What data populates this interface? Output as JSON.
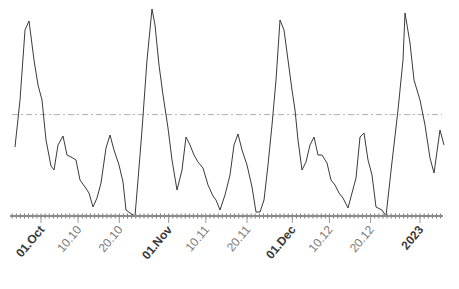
{
  "chart_data": {
    "type": "line",
    "title": "",
    "xlabel": "",
    "ylabel": "",
    "grid": false,
    "legend": null,
    "x_range": [
      "2022-09-27",
      "2023-01-03"
    ],
    "x_tick_labels": [
      {
        "label": "01.Oct",
        "date": "2022-10-01",
        "bold": true
      },
      {
        "label": "10.10",
        "date": "2022-10-10",
        "bold": false
      },
      {
        "label": "20.10",
        "date": "2022-10-20",
        "bold": false
      },
      {
        "label": "01.Nov",
        "date": "2022-11-01",
        "bold": true
      },
      {
        "label": "10.11",
        "date": "2022-11-10",
        "bold": false
      },
      {
        "label": "20.11",
        "date": "2022-11-20",
        "bold": false
      },
      {
        "label": "01.Dec",
        "date": "2022-12-01",
        "bold": true
      },
      {
        "label": "10.12",
        "date": "2022-12-10",
        "bold": false
      },
      {
        "label": "20.12",
        "date": "2022-12-20",
        "bold": false
      },
      {
        "label": "2023",
        "date": "2023-01-01",
        "bold": true
      }
    ],
    "reference_line": {
      "style": "dash-dot",
      "relative_level": 0.49
    },
    "y_axis_visible": false,
    "series": [
      {
        "name": "value",
        "note": "relative values 0 (baseline) to 1 (highest peak), estimated from pixel positions",
        "points_px": [
          [
            15,
            147
          ],
          [
            20,
            100
          ],
          [
            25,
            30
          ],
          [
            29,
            21
          ],
          [
            34,
            60
          ],
          [
            38,
            85
          ],
          [
            42,
            100
          ],
          [
            46,
            140
          ],
          [
            51,
            166
          ],
          [
            54,
            170
          ],
          [
            58,
            145
          ],
          [
            63,
            136
          ],
          [
            67,
            155
          ],
          [
            71,
            157
          ],
          [
            76,
            160
          ],
          [
            80,
            180
          ],
          [
            85,
            187
          ],
          [
            89,
            193
          ],
          [
            93,
            207
          ],
          [
            97,
            198
          ],
          [
            101,
            183
          ],
          [
            106,
            148
          ],
          [
            110,
            135
          ],
          [
            114,
            150
          ],
          [
            119,
            165
          ],
          [
            123,
            182
          ],
          [
            126,
            210
          ],
          [
            130,
            213
          ],
          [
            135,
            216
          ],
          [
            138,
            180
          ],
          [
            142,
            130
          ],
          [
            147,
            60
          ],
          [
            152,
            9
          ],
          [
            155,
            25
          ],
          [
            159,
            65
          ],
          [
            163,
            95
          ],
          [
            168,
            128
          ],
          [
            172,
            160
          ],
          [
            177,
            190
          ],
          [
            182,
            170
          ],
          [
            186,
            137
          ],
          [
            190,
            145
          ],
          [
            194,
            155
          ],
          [
            198,
            162
          ],
          [
            203,
            168
          ],
          [
            208,
            185
          ],
          [
            213,
            196
          ],
          [
            216,
            200
          ],
          [
            220,
            210
          ],
          [
            225,
            195
          ],
          [
            230,
            175
          ],
          [
            234,
            145
          ],
          [
            238,
            134
          ],
          [
            242,
            150
          ],
          [
            247,
            165
          ],
          [
            252,
            187
          ],
          [
            256,
            212
          ],
          [
            260,
            212
          ],
          [
            264,
            200
          ],
          [
            268,
            165
          ],
          [
            272,
            125
          ],
          [
            276,
            80
          ],
          [
            280,
            20
          ],
          [
            284,
            30
          ],
          [
            288,
            60
          ],
          [
            292,
            90
          ],
          [
            295,
            110
          ],
          [
            298,
            140
          ],
          [
            302,
            170
          ],
          [
            306,
            162
          ],
          [
            310,
            145
          ],
          [
            314,
            137
          ],
          [
            318,
            155
          ],
          [
            322,
            155
          ],
          [
            327,
            163
          ],
          [
            331,
            180
          ],
          [
            335,
            185
          ],
          [
            339,
            193
          ],
          [
            343,
            198
          ],
          [
            348,
            208
          ],
          [
            352,
            193
          ],
          [
            356,
            178
          ],
          [
            360,
            137
          ],
          [
            364,
            133
          ],
          [
            368,
            160
          ],
          [
            372,
            175
          ],
          [
            376,
            207
          ],
          [
            382,
            210
          ],
          [
            386,
            216
          ],
          [
            392,
            162
          ],
          [
            398,
            110
          ],
          [
            403,
            60
          ],
          [
            405,
            13
          ],
          [
            410,
            43
          ],
          [
            414,
            80
          ],
          [
            420,
            100
          ],
          [
            425,
            125
          ],
          [
            430,
            158
          ],
          [
            434,
            173
          ],
          [
            440,
            130
          ],
          [
            444,
            145
          ]
        ]
      }
    ],
    "peaks_approx": [
      {
        "date": "2022-10-04",
        "relative": 0.93
      },
      {
        "date": "2022-10-29",
        "relative": 1.0
      },
      {
        "date": "2022-11-26",
        "relative": 0.95
      },
      {
        "date": "2022-12-26",
        "relative": 0.98
      }
    ]
  },
  "axis": {
    "x0_px": 10,
    "x1_px": 443,
    "baseline_y_px": 216,
    "px_per_day": 4.12,
    "origin_date": "2022-10-01",
    "origin_px": 41
  }
}
